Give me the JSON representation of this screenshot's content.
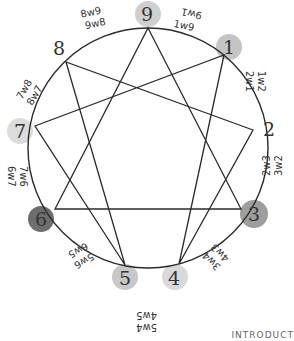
{
  "diagram": {
    "type": "enneagram",
    "points": [
      {
        "number": "9",
        "shade": "#cfcfcf",
        "wings": [
          "8w9",
          "9w8"
        ],
        "wings_right": [
          "9w1",
          "1w9"
        ]
      },
      {
        "number": "1",
        "shade": "#c4c4c4",
        "wings": [
          "1w2",
          "2w1"
        ]
      },
      {
        "number": "2",
        "shade": "none",
        "wings": [
          "2w3",
          "3w2"
        ]
      },
      {
        "number": "3",
        "shade": "#9e9e9e",
        "wings": [
          "3w4",
          "4w3"
        ]
      },
      {
        "number": "4",
        "shade": "#d9d9d9",
        "wings": [
          "4w5",
          "5w4"
        ]
      },
      {
        "number": "5",
        "shade": "#c8c8c8",
        "wings": [
          "5w6",
          "6w5"
        ]
      },
      {
        "number": "6",
        "shade": "#6e6e6e",
        "wings": [
          "6w7",
          "7w6"
        ]
      },
      {
        "number": "7",
        "shade": "#dcdcdc",
        "wings": [
          "7w8",
          "8w7"
        ]
      },
      {
        "number": "8",
        "shade": "none",
        "wings": [
          "8w9",
          "9w8"
        ]
      }
    ],
    "labels": {
      "n9": "9",
      "n1": "1",
      "n2": "2",
      "n3": "3",
      "n4": "4",
      "n5": "5",
      "n6": "6",
      "n7": "7",
      "n8": "8",
      "w98a": "8w9",
      "w98b": "9w8",
      "w91a": "9w1",
      "w91b": "1w9",
      "w12a": "1w2",
      "w12b": "2w1",
      "w23a": "2w3",
      "w23b": "3w2",
      "w34a": "3w4",
      "w34b": "4w3",
      "w45a": "5w4",
      "w45b": "4w5",
      "w56a": "5w6",
      "w56b": "6w5",
      "w67a": "7w6",
      "w67b": "6w7",
      "w78a": "7w8",
      "w78b": "8w7"
    },
    "caption": "INTRODUCT"
  }
}
